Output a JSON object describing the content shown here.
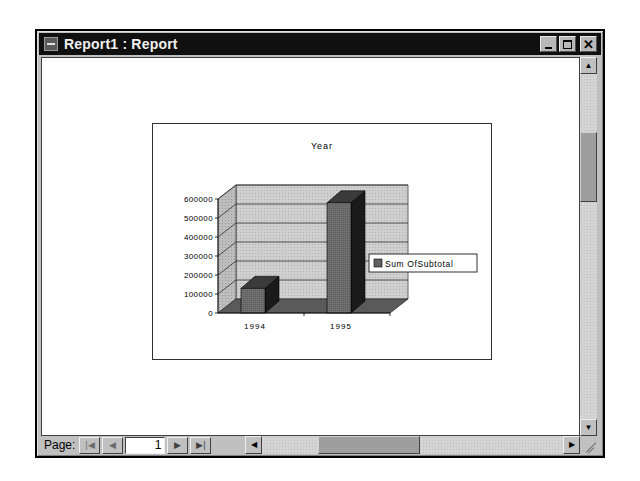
{
  "window": {
    "title": "Report1 : Report",
    "buttons": {
      "minimize": "_",
      "maximize": "□",
      "close": "✕"
    }
  },
  "navigation": {
    "page_label": "Page:",
    "current_page": "1",
    "first_icon": "first-page-icon",
    "prev_icon": "previous-page-icon",
    "next_icon": "next-page-icon",
    "last_icon": "last-page-icon"
  },
  "chart_data": {
    "type": "bar",
    "title": "Year",
    "categories": [
      "1994",
      "1995"
    ],
    "series": [
      {
        "name": "Sum Of Subtotal",
        "values": [
          130000,
          580000
        ],
        "color": "#6e6e6e"
      }
    ],
    "legend": {
      "label": "Sum OfSubtotal",
      "position": "right"
    },
    "yticks": [
      "0",
      "100000",
      "200000",
      "300000",
      "400000",
      "500000",
      "600000"
    ],
    "ylim": [
      0,
      600000
    ],
    "xlabel": "",
    "ylabel": "",
    "grid": true,
    "style": "3d-column"
  }
}
